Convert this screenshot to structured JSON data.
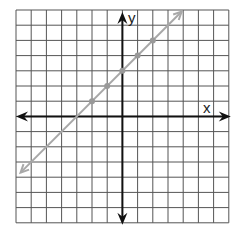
{
  "chart_data": {
    "type": "line",
    "title": "",
    "xlabel": "x",
    "ylabel": "y",
    "xlim": [
      -7,
      7
    ],
    "ylim": [
      -7,
      7
    ],
    "grid": true,
    "grid_cells": 14,
    "series": [
      {
        "name": "line",
        "equation": "y = x + 3",
        "color": "#a8a8a8",
        "points": [
          [
            -2,
            1
          ],
          [
            -1,
            2
          ],
          [
            0,
            3
          ],
          [
            1,
            4
          ],
          [
            2,
            5
          ]
        ],
        "extends_both_directions": true
      }
    ]
  },
  "colors": {
    "grid": "#555555",
    "axis": "#111111",
    "line": "#a8a8a8",
    "points": "#999999"
  },
  "labels": {
    "x": "x",
    "y": "y"
  }
}
